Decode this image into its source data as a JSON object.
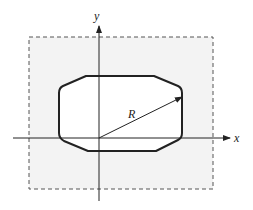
{
  "diagram": {
    "axes": {
      "x_label": "x",
      "y_label": "y"
    },
    "radius_label": "R",
    "shapes": {
      "bounding_region": "dashed rectangle (shaded)",
      "inner_shape": "chamfered rounded rectangle"
    },
    "colors": {
      "background": "#ffffff",
      "region_fill": "#f3f3f3",
      "stroke": "#222222",
      "dashed": "#555555"
    }
  }
}
